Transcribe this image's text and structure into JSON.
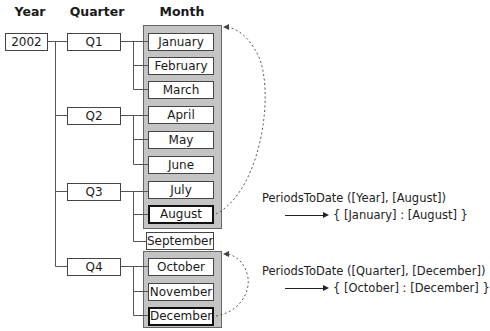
{
  "headers": {
    "year": "Year",
    "quarter": "Quarter",
    "month": "Month"
  },
  "year": "2002",
  "quarters": [
    "Q1",
    "Q2",
    "Q3",
    "Q4"
  ],
  "months": [
    "January",
    "February",
    "March",
    "April",
    "May",
    "June",
    "July",
    "August",
    "September",
    "October",
    "November",
    "December"
  ],
  "highlighted_months": [
    "August",
    "December"
  ],
  "examples": [
    {
      "expression": "PeriodsToDate ([Year], [August])",
      "result": "{ [January] : [August] }"
    },
    {
      "expression": "PeriodsToDate ([Quarter], [December])",
      "result": "{ [October] : [December] }"
    }
  ],
  "colors": {
    "group_fill": "#c4c4c4",
    "box_border": "#444444",
    "line": "#555555"
  }
}
